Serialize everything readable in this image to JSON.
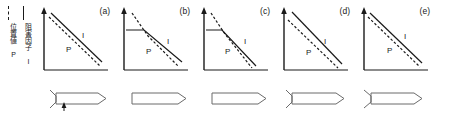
{
  "figure": {
    "background": "#ffffff",
    "ink": "#1a1a1a",
    "legend": {
      "dashed_label": "位置値 P",
      "solid_label": "阻害因子 I",
      "dashed_style": "dashed",
      "solid_style": "solid"
    },
    "axis": {
      "y_arrow": "up-arrow",
      "x_axis": "horizontal-baseline"
    },
    "series_names": {
      "inhibitor": "I",
      "position": "P"
    },
    "panels": [
      {
        "id": "a",
        "label": "(a)",
        "curve_i_label": "I",
        "curve_p_label": "P",
        "pattern": "parallel-straight-decline",
        "specimen": "notched-projectile-with-arrow",
        "has_notch": true,
        "has_arrow": true
      },
      {
        "id": "b",
        "label": "(b)",
        "curve_i_label": "I",
        "curve_p_label": "P",
        "pattern": "flat-then-decline-crossing",
        "specimen": "plain-projectile",
        "has_notch": false,
        "has_arrow": false
      },
      {
        "id": "c",
        "label": "(c)",
        "curve_i_label": "I",
        "curve_p_label": "P",
        "pattern": "flat-then-steep-decline-crossing",
        "specimen": "plain-projectile",
        "has_notch": false,
        "has_arrow": false
      },
      {
        "id": "d",
        "label": "(d)",
        "curve_i_label": "I",
        "curve_p_label": "P",
        "pattern": "parallel-straight-decline",
        "specimen": "notched-projectile",
        "has_notch": true,
        "has_arrow": false
      },
      {
        "id": "e",
        "label": "(e)",
        "curve_i_label": "I",
        "curve_p_label": "P",
        "pattern": "parallel-straight-decline",
        "specimen": "notched-projectile",
        "has_notch": true,
        "has_arrow": false
      }
    ]
  }
}
